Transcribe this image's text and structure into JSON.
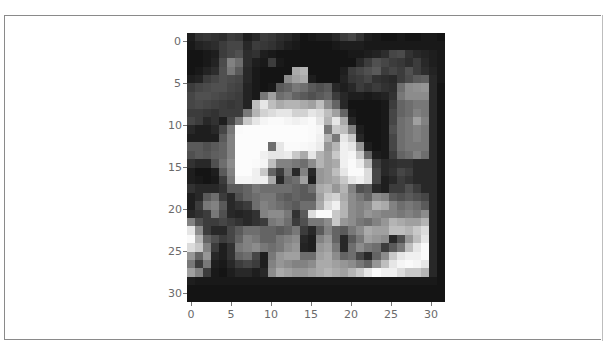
{
  "chart_data": {
    "type": "heatmap",
    "title": "",
    "xlabel": "",
    "ylabel": "",
    "colormap": "gray",
    "shape": [
      32,
      32
    ],
    "xlim": [
      -0.5,
      31.5
    ],
    "ylim": [
      31.5,
      -0.5
    ],
    "x_ticks": [
      "0",
      "5",
      "10",
      "15",
      "20",
      "25",
      "30"
    ],
    "y_ticks": [
      "0",
      "5",
      "10",
      "15",
      "20",
      "25",
      "30"
    ],
    "grid": false,
    "values": [
      [
        30,
        50,
        55,
        50,
        45,
        60,
        55,
        30,
        40,
        60,
        55,
        45,
        40,
        30,
        20,
        25,
        30,
        30,
        40,
        60,
        70,
        50,
        30,
        25,
        20,
        20,
        25,
        20,
        20,
        25,
        25,
        20
      ],
      [
        25,
        35,
        40,
        45,
        60,
        70,
        70,
        40,
        60,
        55,
        50,
        40,
        30,
        25,
        20,
        20,
        20,
        20,
        25,
        30,
        30,
        30,
        25,
        25,
        25,
        25,
        25,
        25,
        25,
        25,
        25,
        25
      ],
      [
        20,
        20,
        25,
        30,
        60,
        70,
        80,
        45,
        50,
        30,
        25,
        20,
        20,
        20,
        20,
        20,
        20,
        20,
        20,
        20,
        25,
        25,
        30,
        35,
        45,
        70,
        75,
        50,
        40,
        35,
        30,
        25
      ],
      [
        20,
        20,
        25,
        35,
        75,
        130,
        110,
        45,
        30,
        25,
        60,
        25,
        20,
        20,
        20,
        20,
        20,
        20,
        20,
        20,
        20,
        40,
        60,
        80,
        70,
        60,
        55,
        45,
        60,
        40,
        30,
        25
      ],
      [
        20,
        25,
        35,
        45,
        80,
        120,
        90,
        40,
        25,
        20,
        20,
        20,
        20,
        170,
        180,
        20,
        20,
        20,
        20,
        30,
        60,
        70,
        80,
        90,
        60,
        70,
        60,
        80,
        60,
        45,
        35,
        25
      ],
      [
        30,
        35,
        60,
        70,
        80,
        75,
        70,
        40,
        25,
        20,
        20,
        20,
        140,
        160,
        170,
        30,
        20,
        20,
        20,
        35,
        55,
        60,
        70,
        50,
        45,
        40,
        60,
        75,
        90,
        95,
        40,
        25
      ],
      [
        60,
        70,
        75,
        80,
        80,
        70,
        65,
        35,
        25,
        20,
        25,
        90,
        100,
        120,
        110,
        90,
        80,
        90,
        40,
        30,
        40,
        60,
        50,
        60,
        50,
        45,
        110,
        140,
        145,
        150,
        40,
        20
      ],
      [
        70,
        80,
        80,
        75,
        70,
        65,
        60,
        35,
        25,
        120,
        160,
        110,
        120,
        100,
        90,
        80,
        90,
        100,
        60,
        40,
        30,
        30,
        25,
        30,
        35,
        50,
        120,
        140,
        140,
        140,
        40,
        20
      ],
      [
        70,
        75,
        70,
        65,
        60,
        55,
        60,
        35,
        190,
        230,
        190,
        170,
        180,
        180,
        170,
        160,
        190,
        140,
        100,
        40,
        20,
        20,
        20,
        20,
        25,
        60,
        100,
        110,
        120,
        120,
        40,
        20
      ],
      [
        60,
        60,
        55,
        50,
        60,
        60,
        60,
        120,
        180,
        210,
        220,
        230,
        230,
        210,
        210,
        230,
        220,
        190,
        160,
        100,
        25,
        20,
        20,
        20,
        25,
        70,
        100,
        110,
        130,
        120,
        40,
        20
      ],
      [
        70,
        60,
        40,
        50,
        30,
        70,
        120,
        200,
        230,
        245,
        250,
        250,
        245,
        240,
        245,
        250,
        230,
        180,
        230,
        170,
        40,
        20,
        20,
        20,
        25,
        70,
        110,
        120,
        160,
        130,
        40,
        20
      ],
      [
        40,
        30,
        30,
        40,
        70,
        120,
        250,
        252,
        252,
        252,
        252,
        252,
        252,
        252,
        252,
        250,
        245,
        120,
        200,
        190,
        130,
        30,
        20,
        20,
        25,
        80,
        110,
        120,
        130,
        120,
        40,
        20
      ],
      [
        30,
        30,
        30,
        30,
        90,
        130,
        252,
        252,
        252,
        252,
        252,
        252,
        252,
        252,
        252,
        250,
        240,
        180,
        120,
        230,
        200,
        40,
        20,
        20,
        25,
        70,
        110,
        120,
        130,
        120,
        40,
        20
      ],
      [
        90,
        90,
        80,
        90,
        100,
        130,
        252,
        252,
        252,
        252,
        110,
        230,
        250,
        250,
        248,
        245,
        235,
        150,
        180,
        240,
        230,
        150,
        30,
        20,
        25,
        70,
        110,
        120,
        120,
        120,
        40,
        20
      ],
      [
        80,
        90,
        85,
        95,
        100,
        130,
        252,
        252,
        252,
        240,
        230,
        230,
        235,
        200,
        170,
        230,
        180,
        160,
        200,
        240,
        245,
        200,
        100,
        30,
        25,
        60,
        100,
        110,
        130,
        110,
        40,
        20
      ],
      [
        50,
        40,
        40,
        80,
        110,
        140,
        252,
        252,
        250,
        245,
        190,
        130,
        130,
        120,
        110,
        140,
        180,
        160,
        170,
        240,
        250,
        235,
        180,
        60,
        40,
        45,
        50,
        50,
        40,
        40,
        40,
        20
      ],
      [
        30,
        20,
        20,
        30,
        90,
        130,
        252,
        252,
        240,
        200,
        100,
        60,
        120,
        40,
        130,
        40,
        150,
        160,
        190,
        230,
        250,
        250,
        220,
        70,
        40,
        50,
        70,
        60,
        40,
        40,
        40,
        20
      ],
      [
        30,
        25,
        20,
        25,
        60,
        120,
        245,
        245,
        240,
        240,
        170,
        40,
        100,
        110,
        160,
        30,
        150,
        160,
        170,
        200,
        230,
        240,
        220,
        70,
        30,
        40,
        60,
        50,
        40,
        40,
        40,
        20
      ],
      [
        50,
        40,
        40,
        40,
        50,
        90,
        90,
        100,
        120,
        110,
        110,
        110,
        110,
        100,
        90,
        110,
        170,
        180,
        150,
        180,
        130,
        80,
        90,
        40,
        30,
        60,
        60,
        80,
        60,
        40,
        40,
        20
      ],
      [
        30,
        40,
        90,
        110,
        60,
        40,
        80,
        100,
        110,
        120,
        120,
        100,
        90,
        100,
        90,
        90,
        160,
        200,
        210,
        170,
        140,
        120,
        100,
        140,
        130,
        90,
        80,
        90,
        80,
        70,
        40,
        20
      ],
      [
        30,
        60,
        120,
        130,
        90,
        40,
        50,
        60,
        110,
        130,
        120,
        110,
        100,
        90,
        110,
        110,
        170,
        220,
        240,
        180,
        140,
        130,
        140,
        180,
        170,
        130,
        110,
        120,
        110,
        90,
        40,
        20
      ],
      [
        40,
        50,
        60,
        120,
        80,
        40,
        35,
        40,
        50,
        130,
        140,
        140,
        120,
        50,
        90,
        220,
        250,
        250,
        200,
        180,
        140,
        130,
        150,
        140,
        130,
        130,
        120,
        130,
        120,
        140,
        40,
        20
      ],
      [
        130,
        80,
        60,
        60,
        70,
        60,
        50,
        40,
        50,
        60,
        120,
        130,
        110,
        60,
        80,
        120,
        120,
        140,
        200,
        150,
        140,
        120,
        110,
        130,
        150,
        180,
        170,
        160,
        160,
        180,
        40,
        20
      ],
      [
        230,
        140,
        60,
        40,
        40,
        70,
        90,
        110,
        110,
        100,
        100,
        90,
        100,
        120,
        60,
        40,
        90,
        130,
        100,
        90,
        120,
        140,
        170,
        160,
        160,
        190,
        190,
        180,
        200,
        220,
        40,
        20
      ],
      [
        250,
        180,
        100,
        80,
        60,
        70,
        100,
        130,
        120,
        100,
        100,
        120,
        130,
        140,
        40,
        30,
        130,
        150,
        100,
        40,
        90,
        120,
        160,
        150,
        140,
        40,
        80,
        150,
        190,
        230,
        40,
        20
      ],
      [
        220,
        200,
        130,
        60,
        30,
        50,
        120,
        130,
        140,
        120,
        110,
        120,
        140,
        150,
        35,
        30,
        150,
        160,
        120,
        40,
        110,
        140,
        120,
        110,
        60,
        90,
        120,
        190,
        230,
        250,
        40,
        20
      ],
      [
        150,
        100,
        150,
        40,
        30,
        50,
        100,
        110,
        70,
        30,
        120,
        150,
        160,
        160,
        110,
        110,
        160,
        170,
        140,
        100,
        110,
        70,
        40,
        100,
        140,
        200,
        230,
        240,
        240,
        250,
        40,
        20
      ],
      [
        120,
        60,
        120,
        30,
        25,
        40,
        60,
        70,
        60,
        30,
        130,
        150,
        140,
        130,
        130,
        140,
        170,
        170,
        160,
        150,
        140,
        120,
        100,
        150,
        190,
        230,
        245,
        250,
        245,
        230,
        40,
        20
      ],
      [
        160,
        130,
        60,
        25,
        20,
        30,
        40,
        40,
        30,
        40,
        140,
        170,
        160,
        150,
        150,
        160,
        170,
        180,
        170,
        160,
        180,
        200,
        230,
        250,
        240,
        240,
        220,
        200,
        200,
        180,
        40,
        20
      ],
      [
        30,
        25,
        25,
        25,
        25,
        25,
        25,
        25,
        25,
        25,
        25,
        25,
        25,
        25,
        25,
        25,
        25,
        25,
        25,
        25,
        25,
        25,
        25,
        25,
        25,
        25,
        25,
        25,
        25,
        25,
        25,
        20
      ],
      [
        20,
        20,
        20,
        20,
        20,
        20,
        20,
        20,
        20,
        20,
        20,
        20,
        20,
        20,
        20,
        20,
        20,
        20,
        20,
        20,
        20,
        20,
        20,
        20,
        20,
        20,
        20,
        20,
        20,
        20,
        20,
        20
      ],
      [
        20,
        20,
        20,
        20,
        20,
        20,
        20,
        20,
        20,
        20,
        20,
        20,
        20,
        20,
        20,
        20,
        20,
        20,
        20,
        20,
        20,
        20,
        20,
        20,
        20,
        20,
        20,
        20,
        20,
        20,
        20,
        20
      ]
    ]
  },
  "axes": {
    "x_ticks": [
      "0",
      "5",
      "10",
      "15",
      "20",
      "25",
      "30"
    ],
    "y_ticks": [
      "0",
      "5",
      "10",
      "15",
      "20",
      "25",
      "30"
    ]
  }
}
